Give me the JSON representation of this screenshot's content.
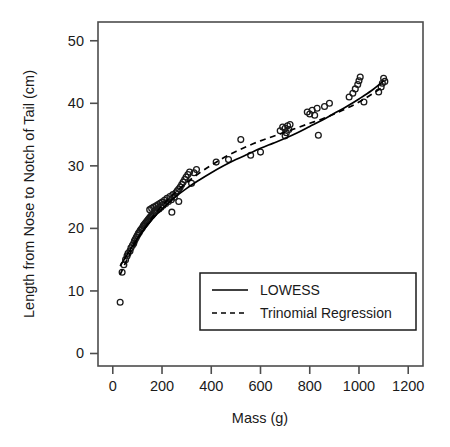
{
  "chart_data": {
    "type": "scatter",
    "title": "",
    "xlabel": "Mass (g)",
    "ylabel": "Length from Nose to Notch of Tail (cm)",
    "xlim": [
      -60,
      1260
    ],
    "ylim": [
      -2,
      53
    ],
    "xticks": [
      0,
      200,
      400,
      600,
      800,
      1000,
      1200
    ],
    "yticks": [
      0,
      10,
      20,
      30,
      40,
      50
    ],
    "xtick_labels": [
      "0",
      "200",
      "400",
      "600",
      "800",
      "1000",
      "1200"
    ],
    "ytick_labels": [
      "0",
      "10",
      "20",
      "30",
      "40",
      "50"
    ],
    "grid": false,
    "legend_position": "bottom-center-inside",
    "marker": "open-circle",
    "points": [
      [
        30,
        8.2
      ],
      [
        38,
        13.0
      ],
      [
        45,
        14.2
      ],
      [
        52,
        15.0
      ],
      [
        58,
        15.6
      ],
      [
        62,
        16.0
      ],
      [
        70,
        16.4
      ],
      [
        74,
        16.9
      ],
      [
        80,
        17.3
      ],
      [
        85,
        17.6
      ],
      [
        88,
        18.0
      ],
      [
        92,
        18.3
      ],
      [
        96,
        18.6
      ],
      [
        100,
        18.9
      ],
      [
        104,
        19.2
      ],
      [
        108,
        19.4
      ],
      [
        112,
        19.7
      ],
      [
        116,
        19.9
      ],
      [
        120,
        20.1
      ],
      [
        124,
        20.4
      ],
      [
        128,
        20.6
      ],
      [
        132,
        20.8
      ],
      [
        136,
        21.0
      ],
      [
        140,
        21.2
      ],
      [
        144,
        21.4
      ],
      [
        148,
        21.6
      ],
      [
        152,
        21.8
      ],
      [
        156,
        22.0
      ],
      [
        160,
        22.1
      ],
      [
        164,
        22.3
      ],
      [
        168,
        22.5
      ],
      [
        150,
        23.0
      ],
      [
        158,
        23.2
      ],
      [
        166,
        23.4
      ],
      [
        172,
        22.8
      ],
      [
        176,
        23.6
      ],
      [
        180,
        22.9
      ],
      [
        184,
        23.8
      ],
      [
        188,
        23.1
      ],
      [
        192,
        24.0
      ],
      [
        196,
        23.4
      ],
      [
        200,
        24.2
      ],
      [
        205,
        23.7
      ],
      [
        210,
        24.5
      ],
      [
        215,
        24.0
      ],
      [
        220,
        24.8
      ],
      [
        226,
        24.3
      ],
      [
        232,
        25.1
      ],
      [
        238,
        24.6
      ],
      [
        244,
        25.4
      ],
      [
        250,
        25.0
      ],
      [
        256,
        25.7
      ],
      [
        262,
        26.0
      ],
      [
        268,
        26.3
      ],
      [
        274,
        26.6
      ],
      [
        280,
        27.0
      ],
      [
        286,
        27.4
      ],
      [
        292,
        27.8
      ],
      [
        298,
        28.2
      ],
      [
        305,
        28.6
      ],
      [
        312,
        29.0
      ],
      [
        240,
        22.6
      ],
      [
        268,
        24.3
      ],
      [
        320,
        27.2
      ],
      [
        330,
        28.9
      ],
      [
        340,
        29.4
      ],
      [
        420,
        30.6
      ],
      [
        470,
        31.0
      ],
      [
        520,
        34.2
      ],
      [
        560,
        31.7
      ],
      [
        600,
        32.2
      ],
      [
        680,
        35.6
      ],
      [
        690,
        36.2
      ],
      [
        700,
        36.0
      ],
      [
        705,
        35.3
      ],
      [
        710,
        36.4
      ],
      [
        715,
        35.8
      ],
      [
        720,
        36.6
      ],
      [
        700,
        34.8
      ],
      [
        790,
        38.6
      ],
      [
        800,
        38.3
      ],
      [
        810,
        38.9
      ],
      [
        820,
        38.1
      ],
      [
        830,
        39.2
      ],
      [
        835,
        34.9
      ],
      [
        860,
        39.5
      ],
      [
        880,
        40.0
      ],
      [
        960,
        41.0
      ],
      [
        975,
        41.6
      ],
      [
        985,
        42.3
      ],
      [
        995,
        43.0
      ],
      [
        1000,
        43.6
      ],
      [
        1005,
        44.2
      ],
      [
        1020,
        40.2
      ],
      [
        1080,
        41.8
      ],
      [
        1090,
        42.6
      ],
      [
        1095,
        43.2
      ],
      [
        1100,
        44.0
      ],
      [
        1105,
        43.5
      ]
    ],
    "series": [
      {
        "name": "LOWESS",
        "style": "solid",
        "x": [
          30,
          60,
          100,
          150,
          200,
          250,
          300,
          350,
          400,
          450,
          500,
          550,
          600,
          650,
          700,
          750,
          800,
          850,
          900,
          950,
          1000,
          1050,
          1100
        ],
        "y": [
          14.0,
          15.9,
          18.4,
          21.0,
          23.1,
          24.9,
          26.4,
          27.7,
          28.9,
          30.0,
          31.0,
          31.9,
          32.8,
          33.6,
          34.4,
          35.3,
          36.3,
          37.3,
          38.4,
          39.5,
          40.7,
          42.0,
          43.6
        ]
      },
      {
        "name": "Trinomial Regression",
        "style": "dashed",
        "x": [
          30,
          60,
          100,
          150,
          200,
          250,
          300,
          350,
          400,
          450,
          500,
          550,
          600,
          650,
          700,
          750,
          800,
          850,
          900,
          950,
          1000,
          1050,
          1100
        ],
        "y": [
          12.6,
          15.2,
          18.2,
          21.2,
          23.6,
          25.6,
          27.3,
          28.8,
          30.1,
          31.3,
          32.3,
          33.2,
          34.0,
          34.7,
          35.4,
          36.1,
          36.8,
          37.5,
          38.3,
          39.2,
          40.2,
          41.4,
          42.7
        ]
      }
    ],
    "legend": [
      {
        "label": "LOWESS",
        "style": "solid"
      },
      {
        "label": "Trinomial Regression",
        "style": "dashed"
      }
    ],
    "colors": {
      "line": "#000000",
      "marker": "#1a1a1a",
      "axis": "#4d4d4d",
      "background": "#ffffff"
    }
  }
}
